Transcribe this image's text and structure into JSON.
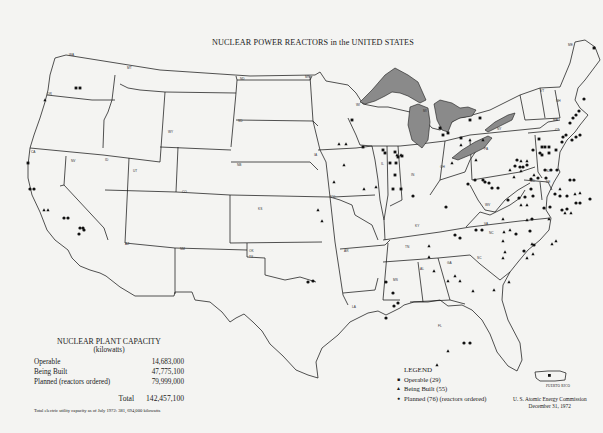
{
  "title": "NUCLEAR POWER REACTORS in the UNITED STATES",
  "capacity": {
    "heading": "NUCLEAR PLANT CAPACITY",
    "units": "(kilowatts)",
    "rows": [
      {
        "label": "Operable",
        "value": "14,683,000"
      },
      {
        "label": "Being Built",
        "value": "47,775,100"
      },
      {
        "label": "Planned (reactors ordered)",
        "value": "79,999,000"
      }
    ],
    "total_label": "Total",
    "total_value": "142,457,100",
    "note": "Total electric utility capacity as of July 1972: 381, 694,000 kilowatts"
  },
  "legend": {
    "heading": "LEGEND",
    "items": [
      {
        "symbol": "square",
        "label": "Operable (29)"
      },
      {
        "symbol": "triangle",
        "label": "Being Built (55)"
      },
      {
        "symbol": "circle",
        "label": "Planned (76) (reactors ordered)"
      }
    ]
  },
  "inset_label": "PUERTO RICO",
  "credit": {
    "line1": "U. S. Atomic Energy Commission",
    "line2": "December 31, 1972"
  },
  "colors": {
    "paper": "#f4f4f2",
    "ink": "#1a1a1a",
    "lakes": "#8a8a8a"
  },
  "state_labels": [
    {
      "abbr": "WA",
      "x": 69,
      "y": 56
    },
    {
      "abbr": "OR",
      "x": 47,
      "y": 95
    },
    {
      "abbr": "CA",
      "x": 31,
      "y": 153
    },
    {
      "abbr": "NV",
      "x": 71,
      "y": 162
    },
    {
      "abbr": "ID",
      "x": 105,
      "y": 161
    },
    {
      "abbr": "MT",
      "x": 127,
      "y": 69
    },
    {
      "abbr": "WY",
      "x": 168,
      "y": 133
    },
    {
      "abbr": "UT",
      "x": 133,
      "y": 172
    },
    {
      "abbr": "CO",
      "x": 182,
      "y": 193
    },
    {
      "abbr": "AZ",
      "x": 125,
      "y": 245
    },
    {
      "abbr": "NM",
      "x": 180,
      "y": 250
    },
    {
      "abbr": "ND",
      "x": 240,
      "y": 80
    },
    {
      "abbr": "SD",
      "x": 238,
      "y": 122
    },
    {
      "abbr": "NB",
      "x": 237,
      "y": 166
    },
    {
      "abbr": "KS",
      "x": 258,
      "y": 210
    },
    {
      "abbr": "OK",
      "x": 249,
      "y": 252
    },
    {
      "abbr": "TX",
      "x": 249,
      "y": 258
    },
    {
      "abbr": "MN",
      "x": 305,
      "y": 78
    },
    {
      "abbr": "IA",
      "x": 314,
      "y": 156
    },
    {
      "abbr": "MO",
      "x": 330,
      "y": 198
    },
    {
      "abbr": "AR",
      "x": 344,
      "y": 252
    },
    {
      "abbr": "LA",
      "x": 352,
      "y": 308
    },
    {
      "abbr": "WI",
      "x": 356,
      "y": 106
    },
    {
      "abbr": "IL",
      "x": 381,
      "y": 165
    },
    {
      "abbr": "MI",
      "x": 423,
      "y": 112
    },
    {
      "abbr": "IN",
      "x": 411,
      "y": 176
    },
    {
      "abbr": "OH",
      "x": 440,
      "y": 168
    },
    {
      "abbr": "KY",
      "x": 415,
      "y": 227
    },
    {
      "abbr": "TN",
      "x": 405,
      "y": 248
    },
    {
      "abbr": "MS",
      "x": 393,
      "y": 281
    },
    {
      "abbr": "AL",
      "x": 420,
      "y": 270
    },
    {
      "abbr": "GA",
      "x": 447,
      "y": 264
    },
    {
      "abbr": "FL",
      "x": 438,
      "y": 327
    },
    {
      "abbr": "SC",
      "x": 477,
      "y": 259
    },
    {
      "abbr": "NC",
      "x": 489,
      "y": 234
    },
    {
      "abbr": "VA",
      "x": 484,
      "y": 225
    },
    {
      "abbr": "WV",
      "x": 485,
      "y": 206
    },
    {
      "abbr": "PA",
      "x": 484,
      "y": 150
    },
    {
      "abbr": "NY",
      "x": 497,
      "y": 130
    },
    {
      "abbr": "VT",
      "x": 540,
      "y": 92
    },
    {
      "abbr": "NH",
      "x": 556,
      "y": 102
    },
    {
      "abbr": "ME",
      "x": 568,
      "y": 46
    },
    {
      "abbr": "MA",
      "x": 553,
      "y": 121
    },
    {
      "abbr": "CT",
      "x": 555,
      "y": 131
    },
    {
      "abbr": "NJ",
      "x": 546,
      "y": 172
    },
    {
      "abbr": "MD",
      "x": 530,
      "y": 182
    },
    {
      "abbr": "DE",
      "x": 546,
      "y": 183
    }
  ],
  "reactors": {
    "operable": [
      [
        76,
        88
      ],
      [
        80,
        88
      ],
      [
        28,
        163
      ],
      [
        352,
        120
      ],
      [
        363,
        147
      ],
      [
        383,
        150
      ],
      [
        385,
        153
      ],
      [
        395,
        152
      ],
      [
        398,
        157
      ],
      [
        402,
        156
      ],
      [
        390,
        163
      ],
      [
        396,
        163
      ],
      [
        395,
        175
      ],
      [
        393,
        189
      ],
      [
        401,
        189
      ],
      [
        470,
        120
      ],
      [
        480,
        118
      ],
      [
        440,
        128
      ],
      [
        443,
        135
      ],
      [
        448,
        133
      ],
      [
        461,
        138
      ],
      [
        539,
        139
      ],
      [
        542,
        147
      ],
      [
        545,
        147
      ],
      [
        549,
        147
      ],
      [
        542,
        155
      ],
      [
        549,
        153
      ],
      [
        556,
        150
      ],
      [
        594,
        48
      ]
    ],
    "being_built": [
      [
        44,
        210
      ],
      [
        48,
        210
      ],
      [
        45,
        100
      ],
      [
        339,
        144
      ],
      [
        346,
        144
      ],
      [
        344,
        165
      ],
      [
        334,
        182
      ],
      [
        318,
        210
      ],
      [
        322,
        221
      ],
      [
        397,
        155
      ],
      [
        401,
        155
      ],
      [
        364,
        189
      ],
      [
        376,
        187
      ],
      [
        461,
        145
      ],
      [
        470,
        140
      ],
      [
        476,
        160
      ],
      [
        483,
        140
      ],
      [
        452,
        163
      ],
      [
        521,
        161
      ],
      [
        527,
        161
      ],
      [
        510,
        170
      ],
      [
        514,
        177
      ],
      [
        521,
        171
      ],
      [
        534,
        175
      ],
      [
        521,
        205
      ],
      [
        527,
        205
      ],
      [
        527,
        220
      ],
      [
        504,
        232
      ],
      [
        510,
        230
      ],
      [
        503,
        219
      ],
      [
        549,
        219
      ],
      [
        565,
        213
      ],
      [
        571,
        213
      ],
      [
        503,
        241
      ],
      [
        503,
        258
      ],
      [
        532,
        244
      ],
      [
        533,
        254
      ],
      [
        527,
        258
      ],
      [
        505,
        252
      ],
      [
        552,
        244
      ],
      [
        556,
        241
      ],
      [
        429,
        246
      ],
      [
        429,
        257
      ],
      [
        455,
        276
      ],
      [
        434,
        271
      ],
      [
        448,
        281
      ],
      [
        460,
        281
      ],
      [
        473,
        291
      ],
      [
        494,
        290
      ],
      [
        509,
        282
      ],
      [
        437,
        365
      ],
      [
        448,
        351
      ],
      [
        560,
        189
      ],
      [
        575,
        194
      ],
      [
        580,
        193
      ]
    ],
    "circle": [
      [
        30,
        189
      ],
      [
        34,
        189
      ],
      [
        64,
        218
      ],
      [
        68,
        218
      ],
      [
        80,
        228
      ],
      [
        83,
        228
      ],
      [
        79,
        234
      ],
      [
        84,
        230
      ],
      [
        308,
        282
      ],
      [
        313,
        281
      ],
      [
        386,
        282
      ],
      [
        393,
        293
      ],
      [
        394,
        306
      ],
      [
        386,
        318
      ],
      [
        464,
        343
      ],
      [
        470,
        343
      ],
      [
        398,
        303
      ],
      [
        531,
        179
      ],
      [
        538,
        178
      ],
      [
        546,
        178
      ],
      [
        545,
        170
      ],
      [
        551,
        170
      ],
      [
        557,
        170
      ],
      [
        570,
        180
      ],
      [
        574,
        180
      ],
      [
        560,
        196
      ],
      [
        567,
        196
      ],
      [
        576,
        203
      ],
      [
        580,
        203
      ],
      [
        468,
        184
      ],
      [
        475,
        180
      ],
      [
        483,
        180
      ],
      [
        485,
        182
      ],
      [
        489,
        183
      ],
      [
        492,
        188
      ],
      [
        498,
        188
      ],
      [
        515,
        166
      ],
      [
        520,
        167
      ],
      [
        533,
        150
      ],
      [
        540,
        153
      ],
      [
        519,
        198
      ],
      [
        525,
        197
      ],
      [
        531,
        189
      ],
      [
        533,
        196
      ],
      [
        562,
        142
      ],
      [
        563,
        137
      ],
      [
        566,
        135
      ],
      [
        572,
        140
      ],
      [
        576,
        137
      ],
      [
        580,
        135
      ],
      [
        570,
        123
      ],
      [
        576,
        115
      ],
      [
        579,
        111
      ],
      [
        573,
        118
      ],
      [
        584,
        99
      ],
      [
        517,
        160
      ],
      [
        523,
        167
      ],
      [
        527,
        165
      ],
      [
        544,
        208
      ],
      [
        550,
        207
      ],
      [
        555,
        194
      ],
      [
        562,
        210
      ],
      [
        567,
        209
      ],
      [
        446,
        207
      ],
      [
        455,
        235
      ],
      [
        460,
        238
      ],
      [
        476,
        230
      ],
      [
        482,
        230
      ],
      [
        508,
        200
      ],
      [
        530,
        231
      ],
      [
        532,
        219
      ],
      [
        516,
        234
      ],
      [
        524,
        251
      ],
      [
        534,
        245
      ],
      [
        413,
        196
      ],
      [
        590,
        199
      ]
    ]
  }
}
